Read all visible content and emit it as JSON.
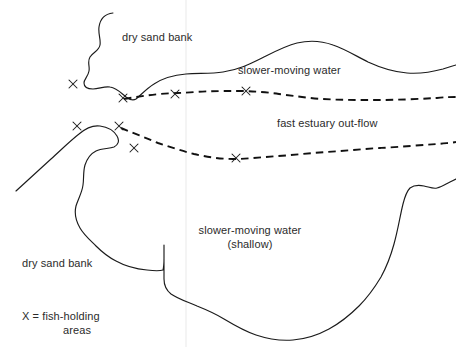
{
  "diagram": {
    "background_color": "#ffffff",
    "line_color": "#1b1b1b",
    "text_color": "#2b2b2b",
    "labels": {
      "dry_sand_bank_top": "dry sand bank",
      "slower_moving_water_top": "slower-moving water",
      "fast_estuary_outflow": "fast estuary out-flow",
      "slower_moving_water_shallow_line1": "slower-moving water",
      "slower_moving_water_shallow_line2": "(shallow)",
      "dry_sand_bank_bottom": "dry sand bank",
      "legend_line1": "X = fish-holding",
      "legend_line2": "areas"
    },
    "markers": {
      "symbol": "X",
      "meaning": "fish-holding areas",
      "count": 7,
      "positions": [
        {
          "id": "x-1",
          "x": 73,
          "y": 84
        },
        {
          "id": "x-2",
          "x": 123,
          "y": 98
        },
        {
          "id": "x-3",
          "x": 175,
          "y": 94
        },
        {
          "id": "x-4",
          "x": 246,
          "y": 91
        },
        {
          "id": "x-5",
          "x": 77,
          "y": 126
        },
        {
          "id": "x-6",
          "x": 119,
          "y": 126
        },
        {
          "id": "x-7",
          "x": 134,
          "y": 148
        },
        {
          "id": "x-8",
          "x": 236,
          "y": 158
        }
      ]
    },
    "features": [
      {
        "name": "dry-sand-bank-upper",
        "type": "landmass"
      },
      {
        "name": "dry-sand-bank-lower",
        "type": "landmass"
      },
      {
        "name": "fast-estuary-outflow-channel-upper",
        "type": "current",
        "style": "dashed"
      },
      {
        "name": "fast-estuary-outflow-channel-lower",
        "type": "current",
        "style": "dashed"
      },
      {
        "name": "slower-moving-water-upper",
        "type": "water"
      },
      {
        "name": "slower-moving-water-shallow",
        "type": "water"
      }
    ]
  }
}
